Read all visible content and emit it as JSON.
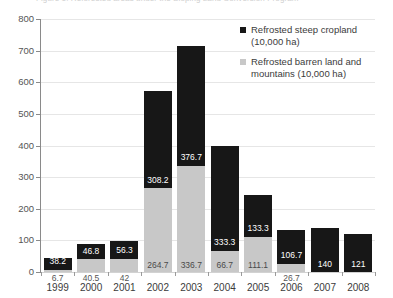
{
  "title_fragment": "Figure 1. Reforested areas under the Sloping Land Conversion Program",
  "legend": {
    "entries": [
      {
        "marker": "black-square-icon",
        "label": "Refrosted steep cropland (10,000 ha)"
      },
      {
        "marker": "gray-square-icon",
        "label": "Refrosted barren land and mountains (10,000 ha)"
      }
    ]
  },
  "chart_data": {
    "type": "bar",
    "stacked": true,
    "title": "Figure 1. Reforested areas under the Sloping Land Conversion Program",
    "xlabel": "",
    "ylabel": "",
    "ylim": [
      0,
      800
    ],
    "yticks": [
      0,
      100,
      200,
      300,
      400,
      500,
      600,
      700,
      800
    ],
    "ytick_labels": [
      "0",
      "100",
      "200",
      "300",
      "400",
      "500",
      "600",
      "700",
      "800"
    ],
    "grid": true,
    "legend_position": "top-right",
    "categories": [
      "1999",
      "2000",
      "2001",
      "2002",
      "2003",
      "2004",
      "2005",
      "2006",
      "2007",
      "2008"
    ],
    "series": [
      {
        "name": "Refrosted barren land and mountains (10,000 ha)",
        "color": "#c8c8c8",
        "values": [
          6.7,
          40.5,
          42,
          264.7,
          336.7,
          66.7,
          111.1,
          26.7,
          0,
          0
        ],
        "labels": [
          "6.7",
          "40.5",
          "42",
          "264.7",
          "336.7",
          "66.7",
          "111.1",
          "26.7",
          "0",
          "0"
        ]
      },
      {
        "name": "Refrosted steep cropland (10,000 ha)",
        "color": "#171717",
        "values": [
          38.2,
          46.8,
          56.3,
          308.2,
          376.7,
          333.3,
          133.3,
          106.7,
          140,
          121
        ],
        "labels": [
          "38.2",
          "46.8",
          "56.3",
          "308.2",
          "376.7",
          "333.3",
          "133.3",
          "106.7",
          "140",
          "121"
        ]
      }
    ],
    "totals": [
      44.9,
      87.3,
      98.3,
      572.9,
      713.4,
      400.0,
      244.4,
      133.4,
      140,
      121
    ]
  }
}
